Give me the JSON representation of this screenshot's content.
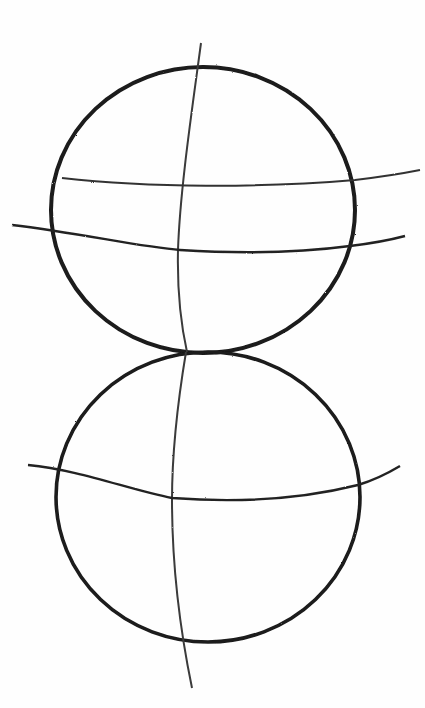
{
  "image": {
    "description": "Pencil sketch of two stacked circles with curved construction guidelines",
    "background_color": "#fefefe",
    "stroke_color": "#1a1a1a",
    "light_stroke_color": "#555555"
  },
  "shapes": {
    "top_circle": {
      "cx": 203,
      "cy": 209,
      "r": 152
    },
    "bottom_circle": {
      "cx": 207,
      "cy": 498,
      "r": 152
    },
    "top_vertical_guide": "M201,43 C192,120 178,200 178,260 C178,300 182,330 187,350",
    "top_horizontal_guide_1": "M62,178 C150,190 260,190 355,180 C380,178 400,175 420,170",
    "top_horizontal_guide_2": "M12,225 C80,235 140,248 180,250 C260,255 320,250 350,245 C375,242 390,238 405,235",
    "bottom_vertical_guide": "M186,352 C178,400 172,450 172,500 C172,560 178,620 192,688",
    "bottom_horizontal_guide": "M28,465 C80,470 130,490 172,498 C250,505 310,495 358,485 C378,480 390,472 400,466"
  }
}
